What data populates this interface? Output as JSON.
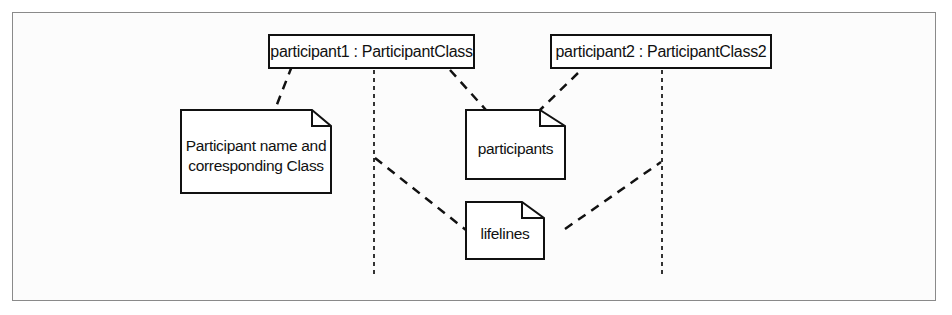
{
  "diagram": {
    "type": "UML sequence diagram",
    "participants": [
      {
        "id": "p1",
        "label": "participant1 : ParticipantClass"
      },
      {
        "id": "p2",
        "label": "participant2 : ParticipantClass2"
      }
    ],
    "notes": [
      {
        "id": "n1",
        "line1": "Participant name and",
        "line2": "corresponding Class"
      },
      {
        "id": "n2",
        "text": "participants"
      },
      {
        "id": "n3",
        "text": "lifelines"
      }
    ],
    "colors": {
      "stroke": "#111111",
      "frame": "#8a8a8a",
      "background": "#ffffff"
    }
  }
}
